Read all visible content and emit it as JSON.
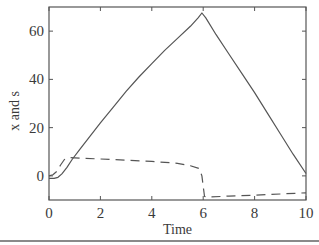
{
  "chart_data": {
    "type": "line",
    "title": "",
    "xlabel": "Time",
    "ylabel": "x and s",
    "xlim": [
      0,
      10
    ],
    "ylim": [
      -10,
      70
    ],
    "xticks": [
      0,
      2,
      4,
      6,
      8,
      10
    ],
    "yticks": [
      0,
      20,
      40,
      60
    ],
    "xtick_labels": [
      "0",
      "2",
      "4",
      "6",
      "8",
      "10"
    ],
    "ytick_labels": [
      "0",
      "20",
      "40",
      "60"
    ],
    "grid": false,
    "legend": null,
    "series": [
      {
        "name": "x",
        "style": "solid",
        "color": "#555555",
        "x": [
          0,
          0.2,
          0.35,
          0.5,
          0.7,
          0.9,
          1.2,
          1.6,
          2.0,
          2.5,
          3.0,
          3.5,
          4.0,
          4.5,
          5.0,
          5.5,
          5.8,
          5.95,
          6.1,
          6.5,
          7.0,
          7.5,
          8.0,
          8.5,
          9.0,
          9.5,
          10.0
        ],
        "values": [
          -1.0,
          -1.0,
          -0.6,
          0.8,
          3.5,
          6.8,
          11.0,
          16.5,
          22.0,
          28.5,
          35.0,
          41.0,
          46.5,
          52.0,
          57.0,
          62.0,
          65.5,
          67.5,
          65.5,
          58.5,
          50.5,
          42.5,
          34.5,
          26.0,
          17.5,
          9.0,
          1.0
        ]
      },
      {
        "name": "s",
        "style": "dashed",
        "color": "#555555",
        "x": [
          0,
          0.15,
          0.3,
          0.45,
          0.6,
          0.75,
          1.0,
          2.0,
          3.0,
          4.0,
          5.0,
          5.5,
          5.85,
          5.95,
          6.05,
          6.2,
          7.0,
          8.0,
          9.0,
          10.0
        ],
        "values": [
          0.0,
          0.5,
          1.8,
          4.5,
          6.8,
          7.6,
          7.5,
          7.0,
          6.5,
          6.0,
          5.2,
          4.2,
          3.0,
          0.0,
          -8.5,
          -8.8,
          -8.4,
          -8.0,
          -7.5,
          -7.0
        ]
      }
    ]
  }
}
